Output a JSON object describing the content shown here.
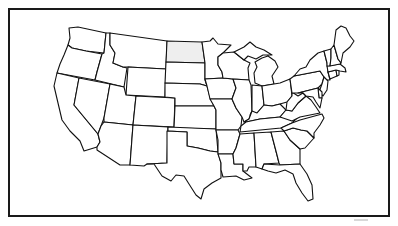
{
  "map": {
    "title": "United States outline map",
    "highlighted_state": "North Dakota",
    "highlight_color": "#eeeeee",
    "fill_color": "#ffffff",
    "stroke_color": "#111111",
    "frame_color": "#1a1a1a",
    "states": [
      {
        "id": "WA",
        "name": "Washington"
      },
      {
        "id": "OR",
        "name": "Oregon"
      },
      {
        "id": "CA",
        "name": "California"
      },
      {
        "id": "ID",
        "name": "Idaho"
      },
      {
        "id": "NV",
        "name": "Nevada"
      },
      {
        "id": "MT",
        "name": "Montana"
      },
      {
        "id": "WY",
        "name": "Wyoming"
      },
      {
        "id": "UT",
        "name": "Utah"
      },
      {
        "id": "AZ",
        "name": "Arizona"
      },
      {
        "id": "CO",
        "name": "Colorado"
      },
      {
        "id": "NM",
        "name": "New Mexico"
      },
      {
        "id": "ND",
        "name": "North Dakota"
      },
      {
        "id": "SD",
        "name": "South Dakota"
      },
      {
        "id": "NE",
        "name": "Nebraska"
      },
      {
        "id": "KS",
        "name": "Kansas"
      },
      {
        "id": "OK",
        "name": "Oklahoma"
      },
      {
        "id": "TX",
        "name": "Texas"
      },
      {
        "id": "MN",
        "name": "Minnesota"
      },
      {
        "id": "IA",
        "name": "Iowa"
      },
      {
        "id": "MO",
        "name": "Missouri"
      },
      {
        "id": "AR",
        "name": "Arkansas"
      },
      {
        "id": "LA",
        "name": "Louisiana"
      },
      {
        "id": "WI",
        "name": "Wisconsin"
      },
      {
        "id": "IL",
        "name": "Illinois"
      },
      {
        "id": "MI",
        "name": "Michigan"
      },
      {
        "id": "IN",
        "name": "Indiana"
      },
      {
        "id": "OH",
        "name": "Ohio"
      },
      {
        "id": "KY",
        "name": "Kentucky"
      },
      {
        "id": "TN",
        "name": "Tennessee"
      },
      {
        "id": "MS",
        "name": "Mississippi"
      },
      {
        "id": "AL",
        "name": "Alabama"
      },
      {
        "id": "GA",
        "name": "Georgia"
      },
      {
        "id": "FL",
        "name": "Florida"
      },
      {
        "id": "SC",
        "name": "South Carolina"
      },
      {
        "id": "NC",
        "name": "North Carolina"
      },
      {
        "id": "VA",
        "name": "Virginia"
      },
      {
        "id": "WV",
        "name": "West Virginia"
      },
      {
        "id": "PA",
        "name": "Pennsylvania"
      },
      {
        "id": "NY",
        "name": "New York"
      },
      {
        "id": "NJ",
        "name": "New Jersey"
      },
      {
        "id": "DE",
        "name": "Delaware"
      },
      {
        "id": "MD",
        "name": "Maryland"
      },
      {
        "id": "CT",
        "name": "Connecticut"
      },
      {
        "id": "RI",
        "name": "Rhode Island"
      },
      {
        "id": "MA",
        "name": "Massachusetts"
      },
      {
        "id": "VT",
        "name": "Vermont"
      },
      {
        "id": "NH",
        "name": "New Hampshire"
      },
      {
        "id": "ME",
        "name": "Maine"
      }
    ]
  }
}
